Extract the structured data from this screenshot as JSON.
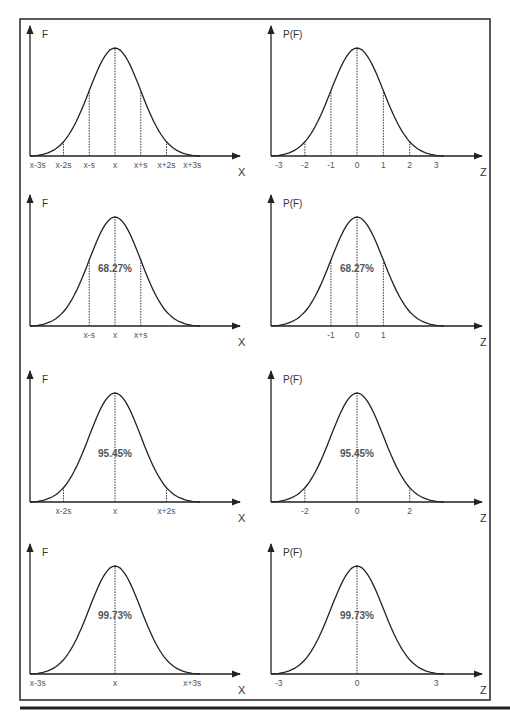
{
  "figure": {
    "frame": {
      "x": 20,
      "y": 19,
      "w": 470,
      "h": 681
    },
    "bottom_rule_y": 708
  },
  "panels": [
    {
      "row": 0,
      "col": 0,
      "ylabel": "F",
      "xlabel": "X",
      "ticks": [
        "x-3s",
        "x-2s",
        "x-s",
        "x",
        "x+s",
        "x+2s",
        "x+3s"
      ],
      "tick_z": [
        -3,
        -2,
        -1,
        0,
        1,
        2,
        3
      ],
      "percent": ""
    },
    {
      "row": 0,
      "col": 1,
      "ylabel": "P(F)",
      "xlabel": "Z",
      "ticks": [
        "-3",
        "-2",
        "-1",
        "0",
        "1",
        "2",
        "3"
      ],
      "tick_z": [
        -3,
        -2,
        -1,
        0,
        1,
        2,
        3
      ],
      "percent": ""
    },
    {
      "row": 1,
      "col": 0,
      "ylabel": "F",
      "xlabel": "X",
      "ticks": [
        "x-s",
        "x",
        "x+s"
      ],
      "tick_z": [
        -1,
        0,
        1
      ],
      "percent": "68.27%"
    },
    {
      "row": 1,
      "col": 1,
      "ylabel": "P(F)",
      "xlabel": "Z",
      "ticks": [
        "-1",
        "0",
        "1"
      ],
      "tick_z": [
        -1,
        0,
        1
      ],
      "percent": "68.27%"
    },
    {
      "row": 2,
      "col": 0,
      "ylabel": "F",
      "xlabel": "X",
      "ticks": [
        "x-2s",
        "x",
        "x+2s"
      ],
      "tick_z": [
        -2,
        0,
        2
      ],
      "percent": "95.45%"
    },
    {
      "row": 2,
      "col": 1,
      "ylabel": "P(F)",
      "xlabel": "Z",
      "ticks": [
        "-2",
        "0",
        "2"
      ],
      "tick_z": [
        -2,
        0,
        2
      ],
      "percent": "95.45%"
    },
    {
      "row": 3,
      "col": 0,
      "ylabel": "F",
      "xlabel": "X",
      "ticks": [
        "x-3s",
        "x",
        "x+3s"
      ],
      "tick_z": [
        -3,
        0,
        3
      ],
      "percent": "99.73%"
    },
    {
      "row": 3,
      "col": 1,
      "ylabel": "P(F)",
      "xlabel": "Z",
      "ticks": [
        "-3",
        "0",
        "3"
      ],
      "tick_z": [
        -3,
        0,
        3
      ],
      "percent": "99.73%"
    }
  ],
  "chart_data": [
    {
      "type": "line",
      "title": "Normal distribution with standard deviation markers",
      "xlabel": "X",
      "ylabel": "F",
      "categories": [
        "x-3s",
        "x-2s",
        "x-s",
        "x",
        "x+s",
        "x+2s",
        "x+3s"
      ],
      "annotations": [],
      "grid": false
    },
    {
      "type": "line",
      "title": "Standard normal distribution with z markers",
      "xlabel": "Z",
      "ylabel": "P(F)",
      "categories": [
        "-3",
        "-2",
        "-1",
        "0",
        "1",
        "2",
        "3"
      ],
      "annotations": [],
      "grid": false
    },
    {
      "type": "area",
      "title": "Area within ±1s",
      "xlabel": "X",
      "ylabel": "F",
      "categories": [
        "x-s",
        "x",
        "x+s"
      ],
      "annotations": [
        "68.27%"
      ],
      "values": [
        68.27
      ]
    },
    {
      "type": "area",
      "title": "Area within ±1 z",
      "xlabel": "Z",
      "ylabel": "P(F)",
      "categories": [
        "-1",
        "0",
        "1"
      ],
      "annotations": [
        "68.27%"
      ],
      "values": [
        68.27
      ]
    },
    {
      "type": "area",
      "title": "Area within ±2s",
      "xlabel": "X",
      "ylabel": "F",
      "categories": [
        "x-2s",
        "x",
        "x+2s"
      ],
      "annotations": [
        "95.45%"
      ],
      "values": [
        95.45
      ]
    },
    {
      "type": "area",
      "title": "Area within ±2 z",
      "xlabel": "Z",
      "ylabel": "P(F)",
      "categories": [
        "-2",
        "0",
        "2"
      ],
      "annotations": [
        "95.45%"
      ],
      "values": [
        95.45
      ]
    },
    {
      "type": "area",
      "title": "Area within ±3s",
      "xlabel": "X",
      "ylabel": "F",
      "categories": [
        "x-3s",
        "x",
        "x+3s"
      ],
      "annotations": [
        "99.73%"
      ],
      "values": [
        99.73
      ]
    },
    {
      "type": "area",
      "title": "Area within ±3 z",
      "xlabel": "Z",
      "ylabel": "P(F)",
      "categories": [
        "-3",
        "0",
        "3"
      ],
      "annotations": [
        "99.73%"
      ],
      "values": [
        99.73
      ]
    }
  ]
}
